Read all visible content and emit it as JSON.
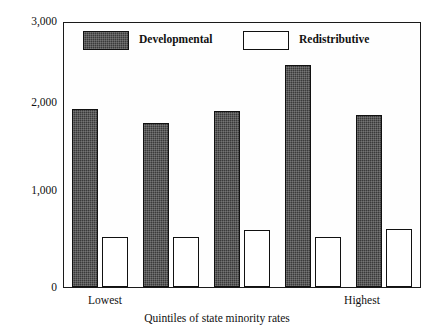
{
  "chart_data": {
    "type": "bar",
    "title": "",
    "xlabel": "Quintiles of state minority rates",
    "ylabel": "",
    "categories": [
      "1",
      "2",
      "3",
      "4",
      "5"
    ],
    "category_edge_labels": {
      "first": "Lowest",
      "last": "Highest"
    },
    "series": [
      {
        "name": "Developmental",
        "values": [
          2030,
          1870,
          2000,
          2530,
          1960
        ]
      },
      {
        "name": "Redistributive",
        "values": [
          560,
          570,
          650,
          570,
          660
        ]
      }
    ],
    "ylim": [
      0,
      3000
    ],
    "yticks_major": [
      0,
      1000,
      2000,
      3000
    ],
    "yticks_major_labels": [
      "0",
      "1,000",
      "2,000",
      "3,000"
    ],
    "yticks_minor": [
      500,
      1500,
      2500
    ],
    "grid": false,
    "legend_position": "inside-top"
  },
  "legend": {
    "items": [
      {
        "label": "Developmental",
        "swatch": "dark-filled"
      },
      {
        "label": "Redistributive",
        "swatch": "white-outlined"
      }
    ]
  },
  "axis": {
    "x_title": "Quintiles of state minority rates",
    "x_labels": [
      "Lowest",
      "Highest"
    ],
    "y_labels": [
      "3,000",
      "2,000",
      "1,000",
      "0"
    ]
  },
  "colors": {
    "developmental": "#3a3a3a",
    "redistributive": "#ffffff",
    "axis": "#1a1a1a",
    "background": "#ffffff"
  }
}
